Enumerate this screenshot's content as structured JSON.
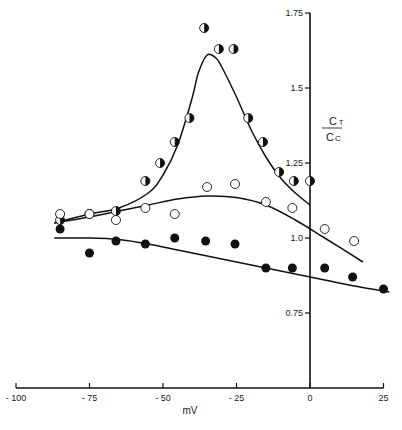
{
  "chart_data": {
    "type": "scatter",
    "title": "",
    "xlabel": "mV",
    "ylabel": "C_T / C_C",
    "ylabel_parts": {
      "numerator": "C",
      "numerator_sub": "T",
      "denominator": "C",
      "denominator_sub": "C"
    },
    "xlim": [
      -100,
      25
    ],
    "ylim": [
      0.5,
      1.8
    ],
    "grid": false,
    "legend": "none",
    "x_ticks": [
      -100,
      -75,
      -50,
      -25,
      0,
      25
    ],
    "x_tick_labels": [
      "- 100",
      "- 75",
      "- 50",
      "- 25",
      "0",
      "25"
    ],
    "y_ticks": [
      0.75,
      1.0,
      1.25,
      1.5,
      1.75
    ],
    "y_tick_labels": [
      "0.75",
      "1.0",
      "1.25",
      "1.5",
      "1.75"
    ],
    "series": [
      {
        "name": "half-filled",
        "marker": "half-filled-circle",
        "x": [
          -85,
          -75,
          -66,
          -56,
          -51,
          -46,
          -41,
          -36,
          -31,
          -26,
          -21,
          -16,
          -10.5,
          -5.5,
          0
        ],
        "y": [
          1.06,
          1.08,
          1.09,
          1.19,
          1.25,
          1.32,
          1.4,
          1.7,
          1.63,
          1.63,
          1.4,
          1.32,
          1.22,
          1.19,
          1.19
        ],
        "fit_curve": {
          "x": [
            -87,
            -75,
            -65,
            -55,
            -50,
            -45,
            -40,
            -38,
            -35,
            -32,
            -30,
            -25,
            -20,
            -15,
            -10,
            -5,
            0
          ],
          "y": [
            1.05,
            1.08,
            1.1,
            1.15,
            1.21,
            1.31,
            1.47,
            1.55,
            1.61,
            1.6,
            1.57,
            1.47,
            1.36,
            1.27,
            1.2,
            1.15,
            1.11
          ]
        }
      },
      {
        "name": "open",
        "marker": "open-circle",
        "x": [
          -85,
          -75,
          -66,
          -56,
          -46,
          -35,
          -25.5,
          -15,
          -6,
          5,
          15
        ],
        "y": [
          1.08,
          1.08,
          1.06,
          1.1,
          1.08,
          1.17,
          1.18,
          1.12,
          1.1,
          1.03,
          0.99
        ],
        "fit_curve": {
          "x": [
            -87,
            -75,
            -65,
            -55,
            -45,
            -35,
            -25,
            -15,
            -5,
            5,
            18
          ],
          "y": [
            1.05,
            1.07,
            1.09,
            1.11,
            1.13,
            1.14,
            1.135,
            1.11,
            1.06,
            1.0,
            0.92
          ]
        }
      },
      {
        "name": "filled",
        "marker": "filled-circle",
        "x": [
          -85,
          -75,
          -66,
          -56,
          -46,
          -35.5,
          -25.5,
          -15,
          -6,
          5,
          14.5,
          25
        ],
        "y": [
          1.03,
          0.95,
          0.99,
          0.98,
          1.0,
          0.99,
          0.98,
          0.9,
          0.9,
          0.9,
          0.87,
          0.83
        ],
        "fit_curve": {
          "x": [
            -87,
            -75,
            -65,
            -55,
            -45,
            -35,
            -25,
            -15,
            -5,
            5,
            15,
            27
          ],
          "y": [
            1.0,
            1.0,
            0.995,
            0.98,
            0.96,
            0.94,
            0.92,
            0.9,
            0.88,
            0.86,
            0.84,
            0.82
          ]
        }
      }
    ],
    "colors": {
      "ink": "#111111",
      "background": "#ffffff"
    }
  }
}
